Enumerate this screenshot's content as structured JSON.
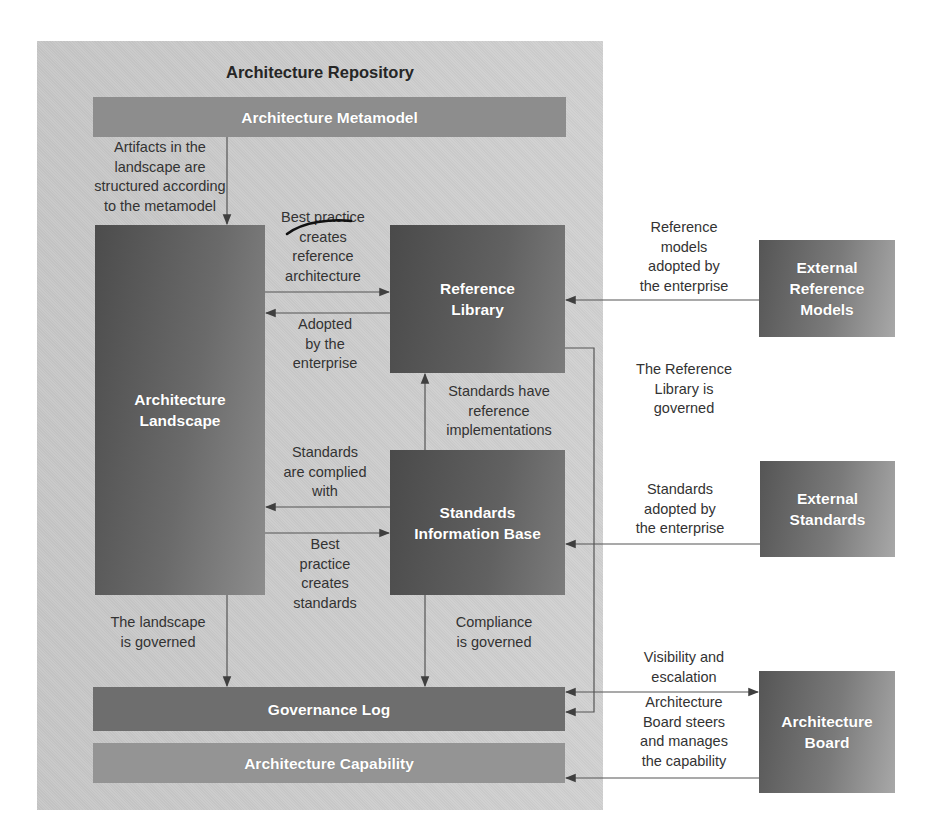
{
  "diagram": {
    "title": "Architecture Repository",
    "nodes": {
      "metamodel": "Architecture Metamodel",
      "landscape": "Architecture\nLandscape",
      "reference_library": "Reference\nLibrary",
      "standards_information_base": "Standards\nInformation Base",
      "governance_log": "Governance Log",
      "architecture_capability": "Architecture Capability",
      "external_reference_models": "External\nReference\nModels",
      "external_standards": "External\nStandards",
      "architecture_board": "Architecture\nBoard"
    },
    "edge_labels": {
      "artifacts_structured": "Artifacts in the\nlandscape are\nstructured according\nto the metamodel",
      "best_practice_reference": "Best practice\ncreates\nreference\narchitecture",
      "adopted_by_enterprise": "Adopted\nby the\nenterprise",
      "standards_have_reference": "Standards have\nreference\nimplementations",
      "standards_complied": "Standards\nare complied\nwith",
      "best_practice_standards": "Best\npractice\ncreates\nstandards",
      "landscape_governed": "The landscape\nis governed",
      "compliance_governed": "Compliance\nis governed",
      "reference_models_adopted": "Reference\nmodels\nadopted by\nthe enterprise",
      "reference_library_governed": "The Reference\nLibrary is\ngoverned",
      "standards_adopted": "Standards\nadopted by\nthe enterprise",
      "visibility_escalation": "Visibility and\nescalation",
      "board_steers": "Architecture\nBoard steers\nand manages\nthe capability"
    },
    "edges": [
      {
        "from": "metamodel",
        "to": "landscape",
        "label": "artifacts_structured"
      },
      {
        "from": "landscape",
        "to": "reference_library",
        "label": "best_practice_reference"
      },
      {
        "from": "reference_library",
        "to": "landscape",
        "label": "adopted_by_enterprise"
      },
      {
        "from": "standards_information_base",
        "to": "reference_library",
        "label": "standards_have_reference"
      },
      {
        "from": "standards_information_base",
        "to": "landscape",
        "label": "standards_complied"
      },
      {
        "from": "landscape",
        "to": "standards_information_base",
        "label": "best_practice_standards"
      },
      {
        "from": "landscape",
        "to": "governance_log",
        "label": "landscape_governed"
      },
      {
        "from": "standards_information_base",
        "to": "governance_log",
        "label": "compliance_governed"
      },
      {
        "from": "external_reference_models",
        "to": "reference_library",
        "label": "reference_models_adopted"
      },
      {
        "from": "reference_library",
        "to": "governance_log",
        "label": "reference_library_governed"
      },
      {
        "from": "external_standards",
        "to": "standards_information_base",
        "label": "standards_adopted"
      },
      {
        "from": "architecture_board",
        "to": "governance_log",
        "label": "visibility_escalation",
        "bidirectional": true
      },
      {
        "from": "architecture_board",
        "to": "architecture_capability",
        "label": "board_steers"
      }
    ]
  }
}
